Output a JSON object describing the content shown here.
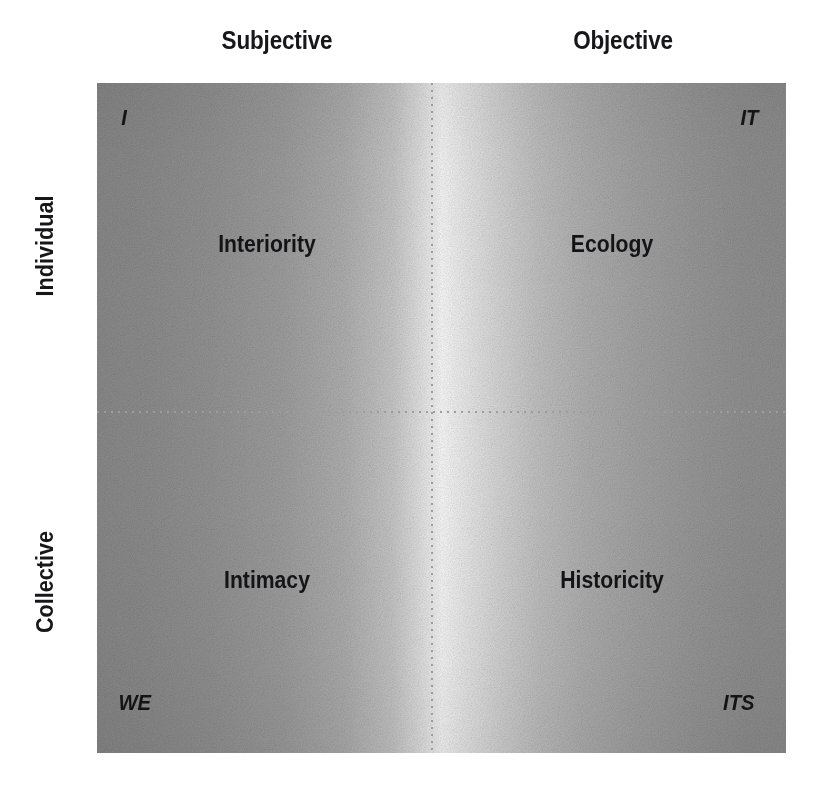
{
  "diagram": {
    "axes": {
      "columns": [
        {
          "id": "subjective",
          "label": "Subjective"
        },
        {
          "id": "objective",
          "label": "Objective"
        }
      ],
      "rows": [
        {
          "id": "individual",
          "label": "Individual"
        },
        {
          "id": "collective",
          "label": "Collective"
        }
      ]
    },
    "quadrants": [
      {
        "id": "upper-left",
        "row": "Individual",
        "column": "Subjective",
        "name": "Interiority",
        "pronoun": "I",
        "pronoun_corner": "top-left"
      },
      {
        "id": "upper-right",
        "row": "Individual",
        "column": "Objective",
        "name": "Ecology",
        "pronoun": "IT",
        "pronoun_corner": "top-right"
      },
      {
        "id": "lower-left",
        "row": "Collective",
        "column": "Subjective",
        "name": "Intimacy",
        "pronoun": "WE",
        "pronoun_corner": "bottom-left"
      },
      {
        "id": "lower-right",
        "row": "Collective",
        "column": "Objective",
        "name": "Historicity",
        "pronoun": "ITS",
        "pronoun_corner": "bottom-right"
      }
    ],
    "style": {
      "text_color": "#141417",
      "divider_color": "#9d9d9d",
      "field_dark": "#8d8d8d",
      "field_light": "#ffffff",
      "background": "#ffffff"
    }
  }
}
